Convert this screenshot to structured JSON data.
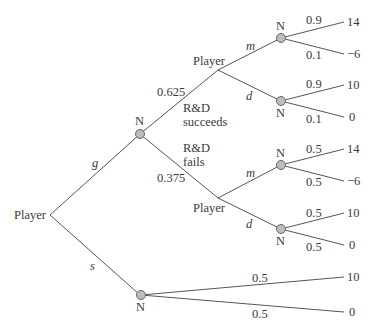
{
  "diagram": {
    "type": "extensive-form game tree",
    "root": {
      "label": "Player"
    },
    "root_actions": {
      "g": "g",
      "s": "s"
    },
    "chance_nodes": {
      "label": "N"
    },
    "rd_chance": {
      "success_prob": "0.625",
      "success_label_1": "R&D",
      "success_label_2": "succeeds",
      "fail_prob": "0.375",
      "fail_label_1": "R&D",
      "fail_label_2": "fails"
    },
    "success_branch": {
      "player_label": "Player",
      "action_m": "m",
      "action_d": "d",
      "m_chance": {
        "p_high": "0.9",
        "p_low": "0.1",
        "payoff_high": "14",
        "payoff_low": "−6"
      },
      "d_chance": {
        "p_high": "0.9",
        "p_low": "0.1",
        "payoff_high": "10",
        "payoff_low": "0"
      }
    },
    "fail_branch": {
      "player_label": "Player",
      "action_m": "m",
      "action_d": "d",
      "m_chance": {
        "p_high": "0.5",
        "p_low": "0.5",
        "payoff_high": "14",
        "payoff_low": "−6"
      },
      "d_chance": {
        "p_high": "0.5",
        "p_low": "0.5",
        "payoff_high": "10",
        "payoff_low": "0"
      }
    },
    "s_branch": {
      "chance": {
        "p_high": "0.5",
        "p_low": "0.5",
        "payoff_high": "10",
        "payoff_low": "0"
      }
    }
  }
}
